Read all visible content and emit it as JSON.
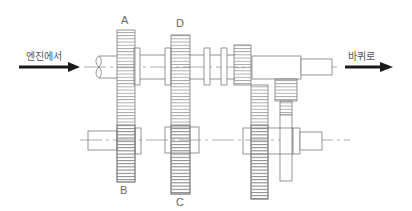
{
  "diagram": {
    "input_label": "엔진에서",
    "output_label": "바퀴로",
    "gear_labels": {
      "A": "A",
      "B": "B",
      "C": "C",
      "D": "D"
    },
    "colors": {
      "line": "#7a7a7a",
      "arrow": "#1a1a1a",
      "centerline": "#9a9a9a",
      "text": "#555555"
    }
  }
}
